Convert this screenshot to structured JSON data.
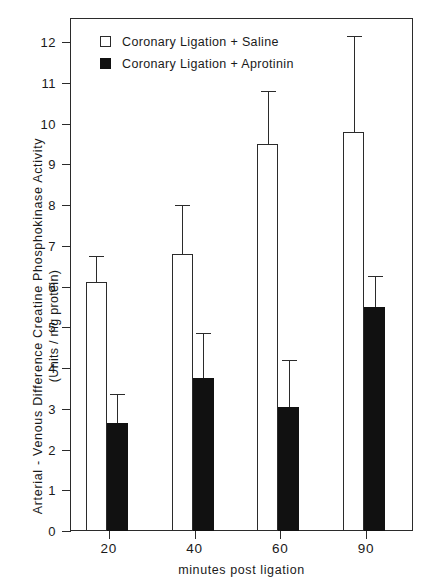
{
  "chart_data": {
    "type": "bar",
    "title": "",
    "xlabel": "minutes post ligation",
    "ylabel": "Arterial - Venous Difference Creatine Phosphokinase Activity",
    "ylabel_units": "(Units / mg protein)",
    "categories": [
      "20",
      "40",
      "60",
      "90"
    ],
    "ylim": [
      0,
      12.6
    ],
    "yticks": [
      0,
      1,
      2,
      3,
      4,
      5,
      6,
      7,
      8,
      9,
      10,
      11,
      12
    ],
    "ytick_labels": [
      "0",
      "1",
      "2",
      "3",
      "4",
      "5",
      "6",
      "7",
      "8",
      "9",
      "10",
      "11",
      "12"
    ],
    "grid": false,
    "legend_position": "upper-left-inside",
    "series": [
      {
        "name": "Coronary Ligation + Saline",
        "style": "open",
        "color": "#ffffff",
        "edge_color": "#2b2b2b",
        "values": [
          6.1,
          6.8,
          9.5,
          9.8
        ],
        "error_upper": [
          6.75,
          8.0,
          10.8,
          12.15
        ]
      },
      {
        "name": "Coronary Ligation + Aprotinin",
        "style": "filled",
        "color": "#111111",
        "edge_color": "#111111",
        "values": [
          2.65,
          3.75,
          3.05,
          5.5
        ],
        "error_upper": [
          3.35,
          4.85,
          4.2,
          6.25
        ]
      }
    ]
  },
  "legend": {
    "items": [
      {
        "label": "Coronary Ligation + Saline",
        "style": "open"
      },
      {
        "label": "Coronary Ligation + Aprotinin",
        "style": "filled"
      }
    ]
  }
}
